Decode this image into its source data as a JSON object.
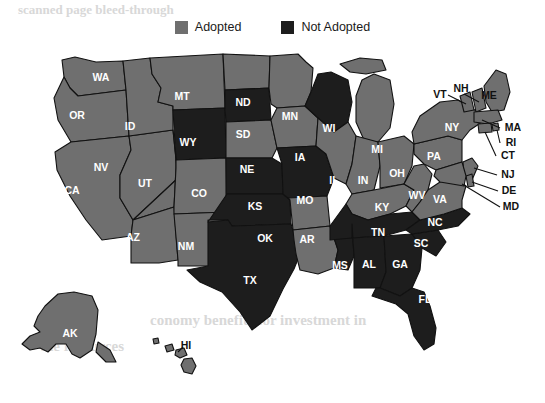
{
  "legend": {
    "items": [
      {
        "label": "Adopted",
        "color": "#6f6f6f",
        "key": "adopted"
      },
      {
        "label": "Not Adopted",
        "color": "#1d1d1d",
        "key": "not_adopted"
      }
    ]
  },
  "colors": {
    "adopted": "#6f6f6f",
    "not_adopted": "#1d1d1d",
    "border": "#111111",
    "label_inside": "#ffffff",
    "label_outside": "#111111",
    "background": "#ffffff",
    "ghost_text": "#d8d8d8"
  },
  "ghost_text": [
    {
      "text": "scanned page bleed-through",
      "x": 18,
      "y": 6
    },
    {
      "text": "conomy benefits for investment in",
      "x": 150,
      "y": 318
    },
    {
      "text": "the resources",
      "x": 40,
      "y": 344
    }
  ],
  "map": {
    "title_visible": false,
    "states": [
      {
        "code": "WA",
        "status": "adopted",
        "label_x": 101,
        "label_y": 34,
        "outside": false
      },
      {
        "code": "OR",
        "status": "adopted",
        "label_x": 77,
        "label_y": 72,
        "outside": false
      },
      {
        "code": "CA",
        "status": "adopted",
        "label_x": 72,
        "label_y": 147,
        "outside": false
      },
      {
        "code": "NV",
        "status": "adopted",
        "label_x": 101,
        "label_y": 124,
        "outside": false
      },
      {
        "code": "ID",
        "status": "adopted",
        "label_x": 130,
        "label_y": 83,
        "outside": false
      },
      {
        "code": "MT",
        "status": "adopted",
        "label_x": 182,
        "label_y": 53,
        "outside": false
      },
      {
        "code": "WY",
        "status": "not_adopted",
        "label_x": 188,
        "label_y": 99,
        "outside": false
      },
      {
        "code": "UT",
        "status": "adopted",
        "label_x": 145,
        "label_y": 140,
        "outside": false
      },
      {
        "code": "AZ",
        "status": "adopted",
        "label_x": 133,
        "label_y": 194,
        "outside": false
      },
      {
        "code": "CO",
        "status": "adopted",
        "label_x": 199,
        "label_y": 150,
        "outside": false
      },
      {
        "code": "NM",
        "status": "adopted",
        "label_x": 186,
        "label_y": 203,
        "outside": false
      },
      {
        "code": "ND",
        "status": "adopted",
        "label_x": 243,
        "label_y": 59,
        "outside": false
      },
      {
        "code": "SD",
        "status": "not_adopted",
        "label_x": 243,
        "label_y": 91,
        "outside": false
      },
      {
        "code": "NE",
        "status": "adopted",
        "label_x": 247,
        "label_y": 126,
        "outside": false
      },
      {
        "code": "KS",
        "status": "not_adopted",
        "label_x": 255,
        "label_y": 163,
        "outside": false
      },
      {
        "code": "OK",
        "status": "not_adopted",
        "label_x": 265,
        "label_y": 195,
        "outside": false
      },
      {
        "code": "TX",
        "status": "not_adopted",
        "label_x": 250,
        "label_y": 237,
        "outside": false
      },
      {
        "code": "MN",
        "status": "adopted",
        "label_x": 290,
        "label_y": 73,
        "outside": false
      },
      {
        "code": "IA",
        "status": "adopted",
        "label_x": 300,
        "label_y": 114,
        "outside": false
      },
      {
        "code": "MO",
        "status": "not_adopted",
        "label_x": 305,
        "label_y": 157,
        "outside": false
      },
      {
        "code": "AR",
        "status": "adopted",
        "label_x": 307,
        "label_y": 196,
        "outside": false
      },
      {
        "code": "LA",
        "status": "adopted",
        "label_x": 313,
        "label_y": 244,
        "outside": false
      },
      {
        "code": "WI",
        "status": "not_adopted",
        "label_x": 329,
        "label_y": 85,
        "outside": false
      },
      {
        "code": "IL",
        "status": "adopted",
        "label_x": 334,
        "label_y": 137,
        "outside": false
      },
      {
        "code": "MS",
        "status": "not_adopted",
        "label_x": 340,
        "label_y": 222,
        "outside": false
      },
      {
        "code": "MI",
        "status": "adopted",
        "label_x": 377,
        "label_y": 106,
        "outside": false
      },
      {
        "code": "IN",
        "status": "adopted",
        "label_x": 363,
        "label_y": 137,
        "outside": false
      },
      {
        "code": "KY",
        "status": "adopted",
        "label_x": 382,
        "label_y": 164,
        "outside": false
      },
      {
        "code": "TN",
        "status": "not_adopted",
        "label_x": 378,
        "label_y": 189,
        "outside": false
      },
      {
        "code": "AL",
        "status": "not_adopted",
        "label_x": 369,
        "label_y": 221,
        "outside": false
      },
      {
        "code": "GA",
        "status": "not_adopted",
        "label_x": 400,
        "label_y": 221,
        "outside": false
      },
      {
        "code": "FL",
        "status": "not_adopted",
        "label_x": 425,
        "label_y": 256,
        "outside": false
      },
      {
        "code": "SC",
        "status": "not_adopted",
        "label_x": 421,
        "label_y": 200,
        "outside": false
      },
      {
        "code": "NC",
        "status": "not_adopted",
        "label_x": 435,
        "label_y": 179,
        "outside": false
      },
      {
        "code": "OH",
        "status": "adopted",
        "label_x": 397,
        "label_y": 130,
        "outside": false
      },
      {
        "code": "WV",
        "status": "adopted",
        "label_x": 417,
        "label_y": 152,
        "outside": false
      },
      {
        "code": "VA",
        "status": "adopted",
        "label_x": 440,
        "label_y": 156,
        "outside": false
      },
      {
        "code": "PA",
        "status": "adopted",
        "label_x": 434,
        "label_y": 113,
        "outside": false
      },
      {
        "code": "NY",
        "status": "adopted",
        "label_x": 452,
        "label_y": 84,
        "outside": false
      },
      {
        "code": "VT",
        "status": "adopted",
        "label_x": 440,
        "label_y": 51,
        "outside": true
      },
      {
        "code": "NH",
        "status": "adopted",
        "label_x": 461,
        "label_y": 45,
        "outside": true
      },
      {
        "code": "ME",
        "status": "adopted",
        "label_x": 489,
        "label_y": 52,
        "outside": true
      },
      {
        "code": "MA",
        "status": "adopted",
        "label_x": 513,
        "label_y": 84,
        "outside": true
      },
      {
        "code": "RI",
        "status": "adopted",
        "label_x": 511,
        "label_y": 99,
        "outside": true
      },
      {
        "code": "CT",
        "status": "adopted",
        "label_x": 508,
        "label_y": 112,
        "outside": true
      },
      {
        "code": "NJ",
        "status": "adopted",
        "label_x": 508,
        "label_y": 131,
        "outside": true
      },
      {
        "code": "DE",
        "status": "adopted",
        "label_x": 509,
        "label_y": 147,
        "outside": true
      },
      {
        "code": "MD",
        "status": "adopted",
        "label_x": 511,
        "label_y": 163,
        "outside": true
      },
      {
        "code": "AK",
        "status": "adopted",
        "label_x": 70,
        "label_y": 290,
        "outside": false
      },
      {
        "code": "HI",
        "status": "adopted",
        "label_x": 186,
        "label_y": 302,
        "outside": true
      }
    ],
    "counts": {
      "adopted": 37,
      "not_adopted": 14
    }
  }
}
